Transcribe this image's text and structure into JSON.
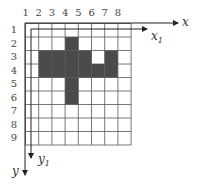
{
  "diagram": {
    "type": "pixel-grid",
    "columns": 8,
    "rows": 9,
    "column_labels": [
      "1",
      "2",
      "3",
      "4",
      "5",
      "6",
      "7",
      "8"
    ],
    "row_labels": [
      "1",
      "2",
      "3",
      "4",
      "5",
      "6",
      "7",
      "8",
      "9"
    ],
    "filled_cells": [
      {
        "row": 2,
        "col": 4
      },
      {
        "row": 3,
        "col": 2
      },
      {
        "row": 3,
        "col": 3
      },
      {
        "row": 3,
        "col": 4
      },
      {
        "row": 3,
        "col": 5
      },
      {
        "row": 3,
        "col": 7
      },
      {
        "row": 4,
        "col": 2
      },
      {
        "row": 4,
        "col": 3
      },
      {
        "row": 4,
        "col": 4
      },
      {
        "row": 4,
        "col": 5
      },
      {
        "row": 4,
        "col": 6
      },
      {
        "row": 4,
        "col": 7
      },
      {
        "row": 5,
        "col": 4
      },
      {
        "row": 6,
        "col": 4
      }
    ],
    "axes": {
      "x": {
        "label": "x"
      },
      "y": {
        "label": "y"
      },
      "x1": {
        "label": "x",
        "subscript": "1"
      },
      "y1": {
        "label": "y",
        "subscript": "1"
      }
    },
    "colors": {
      "fill": "#4a4a4a",
      "grid": "#555555",
      "axis": "#222222"
    }
  }
}
